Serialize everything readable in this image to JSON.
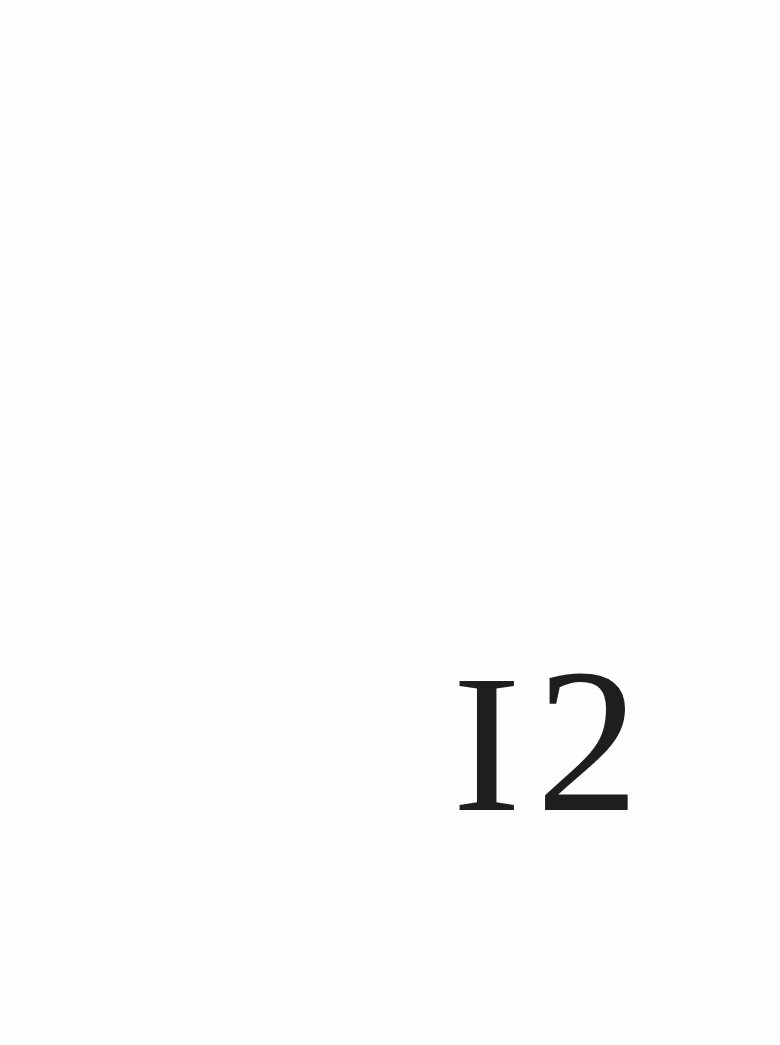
{
  "page": {
    "background": "#ffffff",
    "ink_color": "#1e1e1e"
  },
  "chapter": {
    "number": "12",
    "number_glyphs": [
      "I",
      "2"
    ]
  }
}
